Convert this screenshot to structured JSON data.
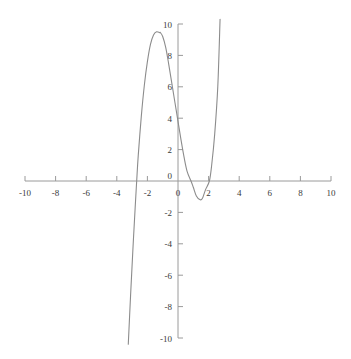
{
  "chart_data": {
    "type": "line",
    "title": "",
    "xlabel": "",
    "ylabel": "",
    "xlim": [
      -10,
      10
    ],
    "ylim": [
      -10,
      10
    ],
    "grid": false,
    "legend": false,
    "axis_style": "centered-cross",
    "xticks": [
      -10,
      -8,
      -6,
      -4,
      -2,
      0,
      2,
      4,
      6,
      8,
      10
    ],
    "xtick_labels": [
      "-10",
      "-8",
      "-6",
      "-4",
      "-2",
      "0",
      "2",
      "4",
      "6",
      "8",
      "10"
    ],
    "yticks": [
      -10,
      -8,
      -6,
      -4,
      -2,
      0,
      2,
      4,
      6,
      8,
      10
    ],
    "ytick_labels": [
      "-10",
      "-8",
      "-6",
      "-4",
      "-2",
      "0",
      "2",
      "4",
      "6",
      "8",
      "10"
    ],
    "series": [
      {
        "name": "cubic-curve",
        "color": "#8c8c8c",
        "linewidth": 1.1,
        "y_intercept": 3.8,
        "local_max": {
          "x": -1.15,
          "y": 9.5
        },
        "local_min": {
          "x": 1.45,
          "y": -1.2
        },
        "roots": [
          -2.7,
          0.85,
          2.05
        ],
        "x": [
          -3.25,
          -3.1,
          -2.95,
          -2.8,
          -2.7,
          -2.6,
          -2.4,
          -2.2,
          -2.0,
          -1.8,
          -1.6,
          -1.4,
          -1.2,
          -1.15,
          -1.0,
          -0.8,
          -0.6,
          -0.4,
          -0.2,
          0.0,
          0.2,
          0.4,
          0.6,
          0.85,
          1.0,
          1.2,
          1.45,
          1.6,
          1.8,
          2.05,
          2.2,
          2.4,
          2.6,
          2.75
        ],
        "y": [
          -10.4,
          -7.3,
          -4.4,
          -1.7,
          0.0,
          1.6,
          4.1,
          6.1,
          7.6,
          8.7,
          9.3,
          9.5,
          9.45,
          9.45,
          9.2,
          8.5,
          7.4,
          6.2,
          5.0,
          3.8,
          2.6,
          1.5,
          0.6,
          0.0,
          -0.4,
          -0.95,
          -1.2,
          -1.1,
          -0.55,
          0.0,
          1.0,
          3.0,
          6.0,
          10.3
        ]
      }
    ]
  },
  "axis": {
    "x_axis_name": "horizontal-axis",
    "y_axis_name": "vertical-axis",
    "axis_color": "#9a9a9a"
  }
}
